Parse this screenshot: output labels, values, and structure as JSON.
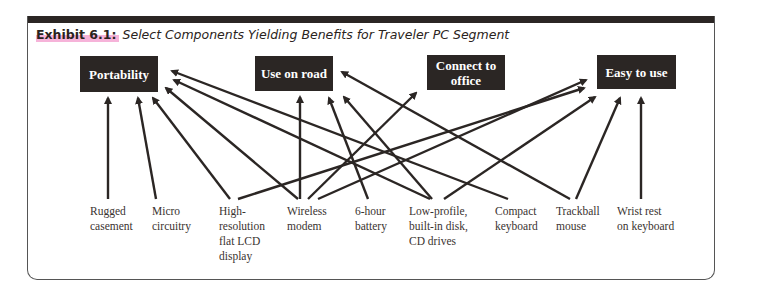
{
  "exhibit": {
    "number": "Exhibit 6.1:",
    "title": "Select Components Yielding Benefits for Traveler PC Segment"
  },
  "benefits": [
    {
      "id": "portability",
      "label": "Portability"
    },
    {
      "id": "use_on_road",
      "label": "Use on road"
    },
    {
      "id": "connect_to_office",
      "label": "Connect to\noffice"
    },
    {
      "id": "easy_to_use",
      "label": "Easy to use"
    }
  ],
  "components": [
    {
      "id": "rugged_casement",
      "label": "Rugged\ncasement"
    },
    {
      "id": "micro_circuitry",
      "label": "Micro\ncircuitry"
    },
    {
      "id": "high_res_display",
      "label": "High-\nresolution\nflat LCD\ndisplay"
    },
    {
      "id": "wireless_modem",
      "label": "Wireless\nmodem"
    },
    {
      "id": "battery",
      "label": "6-hour\nbattery"
    },
    {
      "id": "low_profile_drives",
      "label": "Low-profile,\nbuilt-in disk,\nCD drives"
    },
    {
      "id": "compact_keyboard",
      "label": "Compact\nkeyboard"
    },
    {
      "id": "trackball_mouse",
      "label": "Trackball\nmouse"
    },
    {
      "id": "wrist_rest",
      "label": "Wrist rest\non keyboard"
    }
  ],
  "links": [
    {
      "from": "rugged_casement",
      "to": "portability"
    },
    {
      "from": "micro_circuitry",
      "to": "portability"
    },
    {
      "from": "high_res_display",
      "to": "portability"
    },
    {
      "from": "high_res_display",
      "to": "easy_to_use"
    },
    {
      "from": "wireless_modem",
      "to": "portability"
    },
    {
      "from": "wireless_modem",
      "to": "use_on_road"
    },
    {
      "from": "wireless_modem",
      "to": "connect_to_office"
    },
    {
      "from": "wireless_modem",
      "to": "easy_to_use"
    },
    {
      "from": "battery",
      "to": "use_on_road"
    },
    {
      "from": "low_profile_drives",
      "to": "portability"
    },
    {
      "from": "low_profile_drives",
      "to": "use_on_road"
    },
    {
      "from": "low_profile_drives",
      "to": "easy_to_use"
    },
    {
      "from": "compact_keyboard",
      "to": "portability"
    },
    {
      "from": "trackball_mouse",
      "to": "use_on_road"
    },
    {
      "from": "trackball_mouse",
      "to": "easy_to_use"
    },
    {
      "from": "wrist_rest",
      "to": "easy_to_use"
    }
  ],
  "colors": {
    "box_fill": "#2b2624",
    "arrow": "#2b2624",
    "highlight": "#f6b3d9"
  }
}
